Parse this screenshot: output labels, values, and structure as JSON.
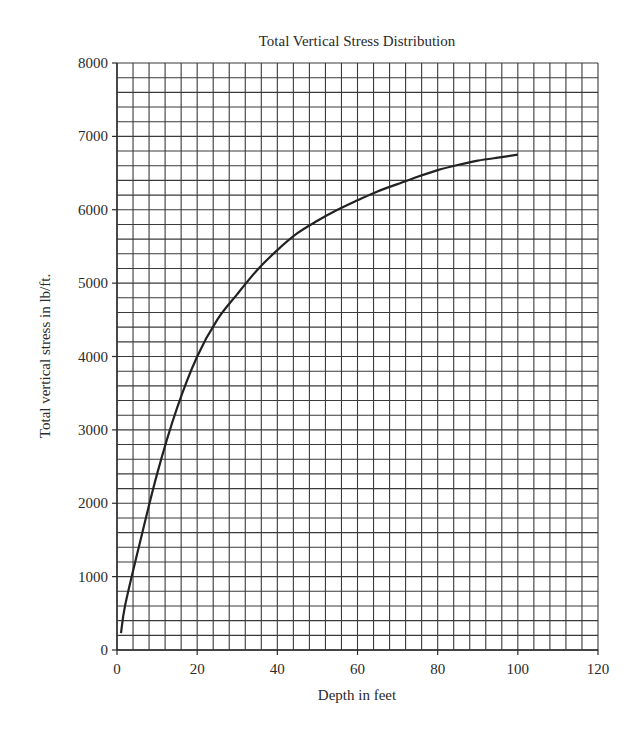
{
  "chart_data": {
    "type": "line",
    "title": "Total Vertical Stress Distribution",
    "xlabel": "Depth in feet",
    "ylabel": "Total vertical stress in lb/ft.",
    "xlim": [
      0,
      120
    ],
    "ylim": [
      0,
      8000
    ],
    "x_ticks": [
      0,
      20,
      40,
      60,
      80,
      100,
      120
    ],
    "y_ticks": [
      0,
      1000,
      2000,
      3000,
      4000,
      5000,
      6000,
      7000,
      8000
    ],
    "grid": true,
    "x_minor_step": 4,
    "y_minor_step": 200,
    "legend": null,
    "series": [
      {
        "name": "Total vertical stress",
        "color": "#222222",
        "x": [
          1,
          2,
          5,
          10,
          15,
          20,
          25,
          30,
          35,
          40,
          45,
          50,
          55,
          60,
          65,
          70,
          75,
          80,
          85,
          90,
          95,
          100
        ],
        "values": [
          230,
          600,
          1300,
          2400,
          3300,
          4000,
          4500,
          4850,
          5180,
          5450,
          5680,
          5850,
          6000,
          6130,
          6250,
          6350,
          6450,
          6540,
          6610,
          6670,
          6710,
          6750
        ]
      }
    ]
  }
}
